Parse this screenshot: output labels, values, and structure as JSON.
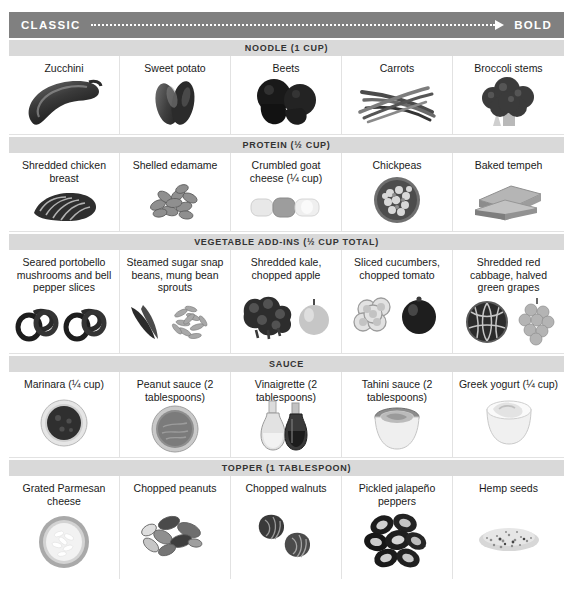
{
  "banner": {
    "left_label": "CLASSIC",
    "right_label": "BOLD",
    "arrow_icon": "dotted-arrow-right-icon",
    "color": "#808080"
  },
  "sections": [
    {
      "id": "noodle",
      "header": "NOODLE (1 CUP)",
      "items": [
        {
          "label": "Zucchini",
          "art": "zucchini"
        },
        {
          "label": "Sweet potato",
          "art": "sweet-potato"
        },
        {
          "label": "Beets",
          "art": "beets"
        },
        {
          "label": "Carrots",
          "art": "carrots"
        },
        {
          "label": "Broccoli stems",
          "art": "broccoli"
        }
      ]
    },
    {
      "id": "protein",
      "header": "PROTEIN (½ CUP)",
      "items": [
        {
          "label": "Shredded chicken breast",
          "art": "shredded-chicken"
        },
        {
          "label": "Shelled edamame",
          "art": "edamame"
        },
        {
          "label": "Crumbled goat cheese (¼ cup)",
          "art": "goat-cheese"
        },
        {
          "label": "Chickpeas",
          "art": "chickpeas"
        },
        {
          "label": "Baked tempeh",
          "art": "tempeh"
        }
      ]
    },
    {
      "id": "vegetable",
      "header": "VEGETABLE ADD-INS (½ CUP TOTAL)",
      "items": [
        {
          "label": "Seared portobello mushrooms and bell pepper slices",
          "art": "pepper-rings"
        },
        {
          "label": "Steamed sugar snap beans, mung bean sprouts",
          "art": "snap-beans-sprouts"
        },
        {
          "label": "Shredded kale, chopped apple",
          "art": "kale-apple"
        },
        {
          "label": "Sliced cucumbers, chopped tomato",
          "art": "cucumber-tomato"
        },
        {
          "label": "Shredded red cabbage, halved green grapes",
          "art": "cabbage-grapes"
        }
      ]
    },
    {
      "id": "sauce",
      "header": "SAUCE",
      "items": [
        {
          "label": "Marinara (¼ cup)",
          "art": "marinara-bowl"
        },
        {
          "label": "Peanut sauce (2 tablespoons)",
          "art": "peanut-bowl"
        },
        {
          "label": "Vinaigrette (2 tablespoons)",
          "art": "cruets"
        },
        {
          "label": "Tahini sauce (2 tablespoons)",
          "art": "tahini-bowl"
        },
        {
          "label": "Greek yogurt (¼ cup)",
          "art": "yogurt-bowl"
        }
      ]
    },
    {
      "id": "topper",
      "header": "TOPPER (1 TABLESPOON)",
      "items": [
        {
          "label": "Grated Parmesan cheese",
          "art": "parmesan-bowl"
        },
        {
          "label": "Chopped peanuts",
          "art": "peanuts"
        },
        {
          "label": "Chopped walnuts",
          "art": "walnuts"
        },
        {
          "label": "Pickled jalapeño peppers",
          "art": "jalapenos"
        },
        {
          "label": "Hemp seeds",
          "art": "hemp-seeds"
        }
      ]
    }
  ]
}
